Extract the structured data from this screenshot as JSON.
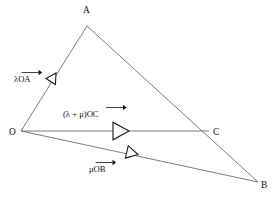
{
  "figure": {
    "background_color": "#ffffff",
    "line_color": "#6e6e6e",
    "ink_color": "#111111",
    "vertices": [
      {
        "name": "O",
        "label": "O",
        "x": 21,
        "y": 131,
        "label_x": 9,
        "label_y": 134
      },
      {
        "name": "A",
        "label": "A",
        "x": 87,
        "y": 26,
        "label_x": 83,
        "label_y": 11
      },
      {
        "name": "B",
        "label": "B",
        "x": 258,
        "y": 182,
        "label_x": 262,
        "label_y": 188
      },
      {
        "name": "C",
        "label": "C",
        "x": 209,
        "y": 131,
        "label_x": 214,
        "label_y": 134
      }
    ],
    "edges": [
      {
        "name": "edge-OA",
        "from": "O",
        "to": "A"
      },
      {
        "name": "edge-AB",
        "from": "A",
        "to": "B"
      },
      {
        "name": "edge-OC",
        "from": "O",
        "to": "C"
      },
      {
        "name": "edge-OB",
        "from": "O",
        "to": "B"
      }
    ],
    "vectors": [
      {
        "name": "vector-lambda-OA",
        "scalar": "λ",
        "segment": "OA",
        "label_text": "λOA",
        "label_x": 14,
        "label_y": 80,
        "arrow_x": 56,
        "arrow_y": 73,
        "arrow_angle_deg": -57.8,
        "arrow_size": 7
      },
      {
        "name": "vector-lambda-plus-mu-OC",
        "scalar": "(λ + μ)",
        "segment": "OC",
        "label_text": "(λ + μ)OC",
        "label_x": 64,
        "label_y": 115,
        "arrow_x": 113,
        "arrow_y": 131,
        "arrow_angle_deg": 0,
        "arrow_size": 11
      },
      {
        "name": "vector-mu-OB",
        "scalar": "μ",
        "segment": "OB",
        "label_text": "μOB",
        "label_x": 89,
        "label_y": 170,
        "arrow_x": 128,
        "arrow_y": 152,
        "arrow_angle_deg": 13.0,
        "arrow_size": 8
      }
    ]
  }
}
